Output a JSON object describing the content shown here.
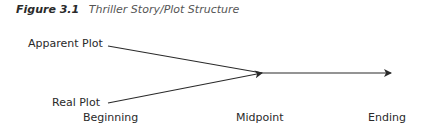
{
  "caption": {
    "number": "Figure 3.1",
    "title": "Thriller Story/Plot Structure"
  },
  "labels": {
    "apparent_plot": "Apparent Plot",
    "real_plot": "Real Plot",
    "beginning": "Beginning",
    "midpoint": "Midpoint",
    "ending": "Ending"
  },
  "colors": {
    "line": "#2a2a2a",
    "text": "#2a2a2a"
  }
}
